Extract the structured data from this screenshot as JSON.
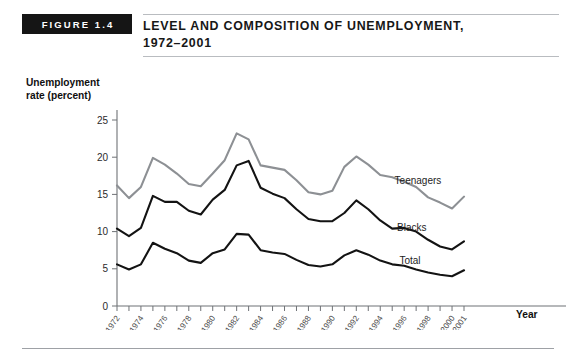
{
  "figure": {
    "tag": "FIGURE 1.4",
    "title_line1": "LEVEL AND COMPOSITION OF UNEMPLOYMENT,",
    "title_line2": "1972–2001"
  },
  "chart_data": {
    "type": "line",
    "xlabel": "Year",
    "ylabel": "Unemployment rate (percent)",
    "ylabel_line1": "Unemployment",
    "ylabel_line2": "rate (percent)",
    "xlim": [
      1972,
      2001
    ],
    "ylim": [
      0,
      25
    ],
    "yticks": [
      0,
      5,
      10,
      15,
      20,
      25
    ],
    "ytick_labels": [
      "0",
      "5",
      "10",
      "15",
      "20",
      "25"
    ],
    "x": [
      1972,
      1973,
      1974,
      1975,
      1976,
      1977,
      1978,
      1979,
      1980,
      1981,
      1982,
      1983,
      1984,
      1985,
      1986,
      1987,
      1988,
      1989,
      1990,
      1991,
      1992,
      1993,
      1994,
      1995,
      1996,
      1997,
      1998,
      1999,
      2000,
      2001
    ],
    "xtick_labels": [
      "1972",
      "1974",
      "1976",
      "1978",
      "1980",
      "1982",
      "1984",
      "1986",
      "1988",
      "1990",
      "1992",
      "1994",
      "1996",
      "1998",
      "2000",
      "2001"
    ],
    "xtick_years": [
      1972,
      1974,
      1976,
      1978,
      1980,
      1982,
      1984,
      1986,
      1988,
      1990,
      1992,
      1994,
      1996,
      1998,
      2000,
      2001
    ],
    "grid": false,
    "legend_position": "inline-right",
    "series": [
      {
        "name": "Teenagers",
        "color": "#8d9094",
        "label_x": 1995.2,
        "label_y": 16.4,
        "values": [
          16.2,
          14.5,
          16.0,
          19.9,
          19.0,
          17.8,
          16.4,
          16.1,
          17.8,
          19.6,
          23.2,
          22.4,
          18.9,
          18.6,
          18.3,
          16.9,
          15.3,
          15.0,
          15.5,
          18.7,
          20.1,
          19.0,
          17.6,
          17.3,
          16.7,
          16.0,
          14.6,
          13.9,
          13.1,
          14.7
        ]
      },
      {
        "name": "Blacks",
        "color": "#131313",
        "label_x": 1995.4,
        "label_y": 10.1,
        "values": [
          10.4,
          9.4,
          10.5,
          14.8,
          14.0,
          14.0,
          12.8,
          12.3,
          14.3,
          15.6,
          18.9,
          19.5,
          15.9,
          15.1,
          14.5,
          13.0,
          11.7,
          11.4,
          11.4,
          12.5,
          14.2,
          13.0,
          11.5,
          10.4,
          10.5,
          10.0,
          8.9,
          8.0,
          7.6,
          8.7
        ]
      },
      {
        "name": "Total",
        "color": "#131313",
        "label_x": 1995.6,
        "label_y": 5.6,
        "values": [
          5.6,
          4.9,
          5.6,
          8.5,
          7.7,
          7.1,
          6.1,
          5.8,
          7.1,
          7.6,
          9.7,
          9.6,
          7.5,
          7.2,
          7.0,
          6.2,
          5.5,
          5.3,
          5.6,
          6.8,
          7.5,
          6.9,
          6.1,
          5.6,
          5.4,
          4.9,
          4.5,
          4.2,
          4.0,
          4.8
        ]
      }
    ]
  }
}
